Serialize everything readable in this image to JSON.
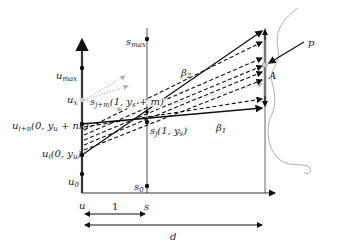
{
  "diagram": {
    "axes": {
      "left": {
        "label": "u",
        "ticks": [
          {
            "name": "u_max",
            "text": "u",
            "sub": "max",
            "y": 68
          },
          {
            "name": "u_x",
            "text": "u",
            "sub": "x",
            "y": 100
          },
          {
            "name": "u_i+n",
            "text": "u",
            "sub": "i+n",
            "tail": "(0, y",
            "tailsub": "u",
            "tailend": " + nk)",
            "y": 124
          },
          {
            "name": "u_i",
            "text": "u",
            "sub": "i",
            "tail": "(0, y",
            "tailsub": "u",
            "tailend": ")",
            "y": 155
          },
          {
            "name": "u_0",
            "text": "u",
            "sub": "0",
            "y": 174
          }
        ]
      },
      "middle": {
        "label": "s",
        "ticks": [
          {
            "name": "s_max",
            "text": "s",
            "sub": "max",
            "y": 39
          },
          {
            "name": "s_0",
            "text": "s",
            "sub": "0",
            "y": 186
          }
        ]
      }
    },
    "labels": {
      "s_j": {
        "text": "s",
        "sub": "j",
        "tail": "(1, y",
        "tailsub": "s",
        "tailend": ")"
      },
      "s_j_plus_m": {
        "text": "s",
        "sub": "j+m",
        "tail": "(1, y",
        "tailsub": "s",
        "tailend": " + m)"
      },
      "beta1": {
        "text": "β",
        "sub": "1"
      },
      "beta2": {
        "text": "β",
        "sub": "2"
      },
      "A": "A",
      "p": "p",
      "u_bottom": "u",
      "s_bottom": "s",
      "one": "1",
      "d": "d"
    },
    "colors": {
      "line": "#111111",
      "axis": "#555555",
      "dotted": "#b0b0b0",
      "curve": "#999999"
    }
  }
}
